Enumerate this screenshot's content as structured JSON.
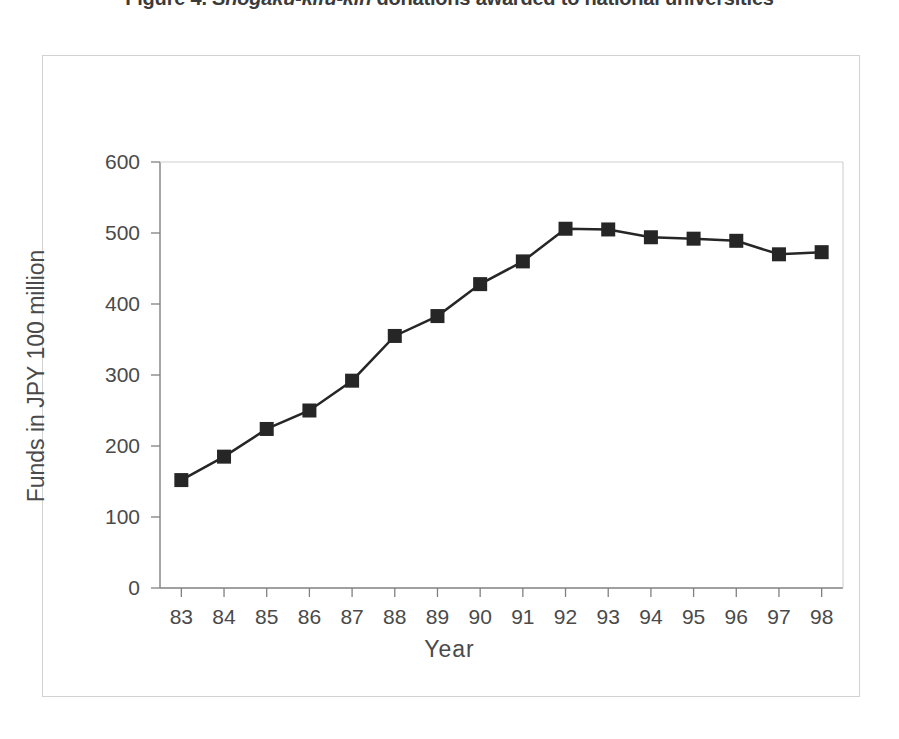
{
  "figure": {
    "caption_label": "Figure 4.",
    "caption_term": "Shogaku-kifu-kin",
    "caption_rest": "donations awarded to national universities"
  },
  "chart_data": {
    "type": "line",
    "title": "",
    "xlabel": "Year",
    "ylabel": "Funds in JPY 100 million",
    "categories": [
      "83",
      "84",
      "85",
      "86",
      "87",
      "88",
      "89",
      "90",
      "91",
      "92",
      "93",
      "94",
      "95",
      "96",
      "97",
      "98"
    ],
    "values": [
      152,
      185,
      224,
      250,
      292,
      355,
      383,
      428,
      460,
      506,
      505,
      494,
      492,
      489,
      470,
      473
    ],
    "ylim": [
      0,
      600
    ],
    "yticks": [
      0,
      100,
      200,
      300,
      400,
      500,
      600
    ],
    "ytick_labels": [
      "0",
      "100",
      "200",
      "300",
      "400",
      "500",
      "600"
    ],
    "grid": false,
    "legend": false,
    "marker": "square",
    "series_color": "#262626",
    "axis_color": "#808080",
    "line_width": 2.5,
    "marker_size": 14
  }
}
